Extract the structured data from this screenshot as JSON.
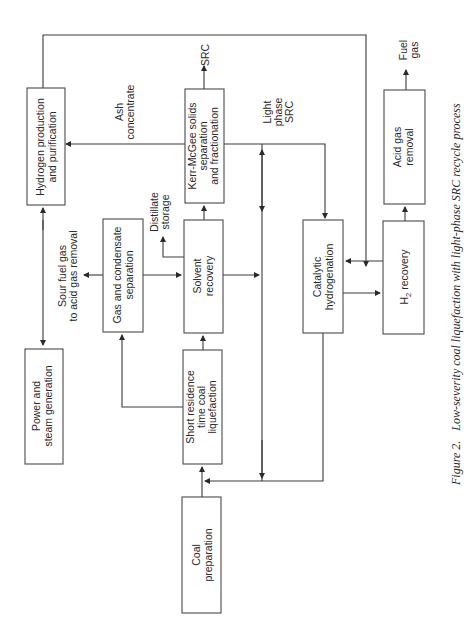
{
  "figure": {
    "caption_number": "Figure 2.",
    "caption_text": "Low-severity coal liquefaction with light-phase SRC recycle process",
    "orientation": "rotated 90° counter-clockwise"
  },
  "boxes": {
    "hydrogen": {
      "line1": "Hydrogen production",
      "line2": "and purification"
    },
    "kerr_mcgee": {
      "line1": "Kerr-McGee solids",
      "line2": "separation",
      "line3": "and fractionation"
    },
    "solvent": {
      "line1": "Solvent",
      "line2": "recovery"
    },
    "gas_condensate": {
      "line1": "Gas and condensate",
      "line2": "separation"
    },
    "short_residence": {
      "line1": "Short residence",
      "line2": "time coal",
      "line3": "liquefaction"
    },
    "coal_prep": {
      "line1": "Coal",
      "line2": "preparation"
    },
    "power_steam": {
      "line1": "Power and",
      "line2": "steam generation"
    },
    "catalytic": {
      "line1": "Catalytic",
      "line2": "hydrogenation"
    },
    "h2_recovery": {
      "label": "H",
      "sub": "2",
      "rest": " recovery"
    },
    "acid_gas": {
      "line1": "Acid gas",
      "line2": "removal"
    }
  },
  "stream_labels": {
    "src": "SRC",
    "fuel_gas_1": "Fuel",
    "fuel_gas_2": "gas",
    "ash_1": "Ash",
    "ash_2": "concentrate",
    "light_1": "Light",
    "light_2": "phase",
    "light_3": "SRC",
    "distillate_1": "Distillate",
    "distillate_2": "storage",
    "sour_1": "Sour fuel gas",
    "sour_2": "to acid gas removal"
  },
  "colors": {
    "line": "#3a3a3a",
    "text": "#2a2a2a",
    "background": "#ffffff"
  }
}
